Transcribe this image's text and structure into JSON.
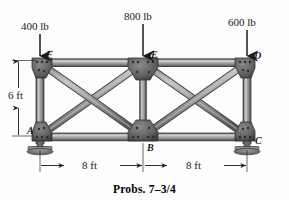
{
  "figure": {
    "caption": "Probs. 7–3/4",
    "type": "truss-free-body-diagram"
  },
  "loads": [
    {
      "id": "load-F",
      "label": "400 lb",
      "at_joint": "F",
      "direction": "down"
    },
    {
      "id": "load-E",
      "label": "800 lb",
      "at_joint": "E",
      "direction": "down"
    },
    {
      "id": "load-D",
      "label": "600 lb",
      "at_joint": "D",
      "direction": "down"
    }
  ],
  "joints": [
    {
      "id": "A",
      "label": "A",
      "x": 40,
      "y": 136,
      "support": "pinned-base-plate"
    },
    {
      "id": "B",
      "label": "B",
      "x": 143,
      "y": 136,
      "support": "none"
    },
    {
      "id": "C",
      "label": "C",
      "x": 247,
      "y": 136,
      "support": "pinned-base-plate"
    },
    {
      "id": "D",
      "label": "D",
      "x": 247,
      "y": 63,
      "support": "none"
    },
    {
      "id": "E",
      "label": "E",
      "x": 143,
      "y": 63,
      "support": "none"
    },
    {
      "id": "F",
      "label": "F",
      "x": 40,
      "y": 63,
      "support": "none"
    }
  ],
  "members": [
    {
      "from": "F",
      "to": "E",
      "kind": "top-chord"
    },
    {
      "from": "E",
      "to": "D",
      "kind": "top-chord"
    },
    {
      "from": "A",
      "to": "B",
      "kind": "bottom-chord"
    },
    {
      "from": "B",
      "to": "C",
      "kind": "bottom-chord"
    },
    {
      "from": "A",
      "to": "F",
      "kind": "vertical"
    },
    {
      "from": "B",
      "to": "E",
      "kind": "vertical"
    },
    {
      "from": "C",
      "to": "D",
      "kind": "vertical"
    },
    {
      "from": "A",
      "to": "E",
      "kind": "diagonal"
    },
    {
      "from": "F",
      "to": "B",
      "kind": "diagonal"
    },
    {
      "from": "B",
      "to": "D",
      "kind": "diagonal"
    },
    {
      "from": "E",
      "to": "C",
      "kind": "diagonal"
    }
  ],
  "dimensions": [
    {
      "id": "height",
      "label": "6 ft",
      "orientation": "vertical",
      "spans": "A to F"
    },
    {
      "id": "span-left",
      "label": "8 ft",
      "orientation": "horizontal",
      "spans": "A to B"
    },
    {
      "id": "span-right",
      "label": "8 ft",
      "orientation": "horizontal",
      "spans": "B to C"
    }
  ],
  "colors": {
    "member_fill": "#a8a8a8",
    "member_edge": "#4a4a4a",
    "gusset": "#5c5c5c",
    "line": "#2b2b2b",
    "support": "#6b6b6b",
    "background": "#fdfdfd"
  }
}
